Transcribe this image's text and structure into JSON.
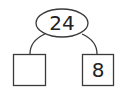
{
  "diagram": {
    "type": "number-bond",
    "whole": {
      "value": "24"
    },
    "parts": [
      {
        "value": ""
      },
      {
        "value": "8"
      }
    ]
  },
  "colors": {
    "stroke": "#3a3a3a",
    "text": "#222222",
    "fill": "#ffffff"
  }
}
